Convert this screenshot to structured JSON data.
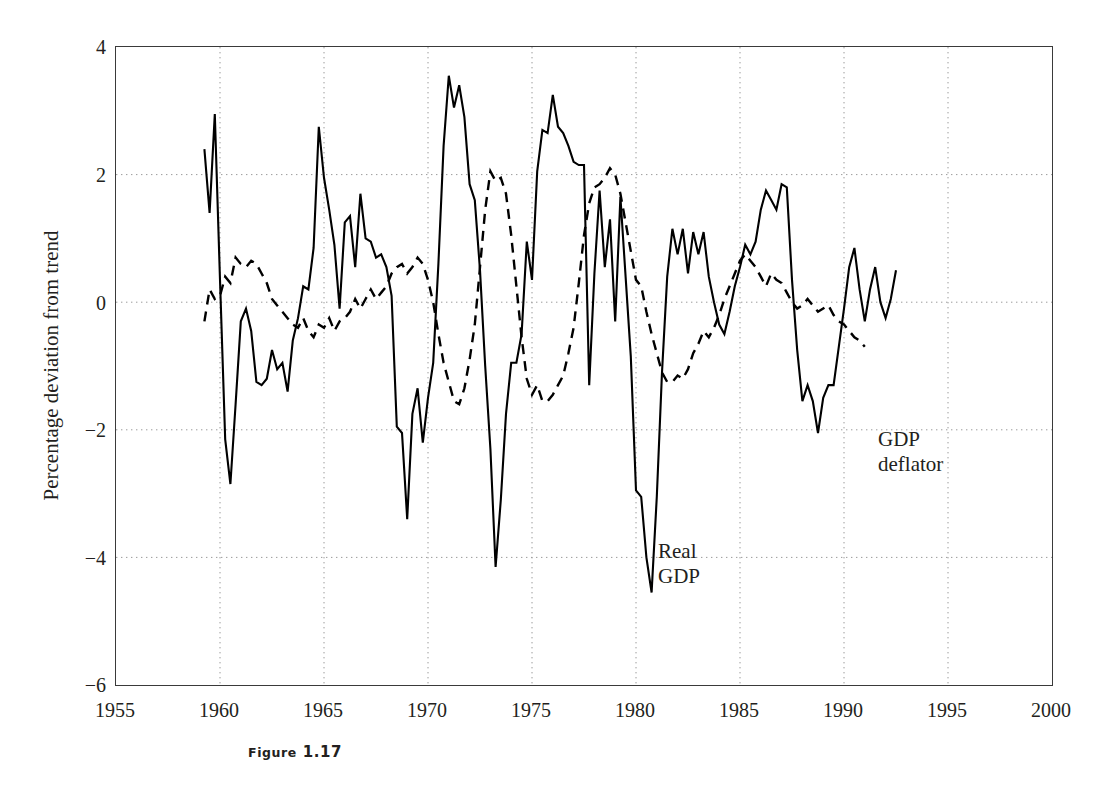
{
  "figure": {
    "caption_label": "Figure",
    "caption_number": "1.17"
  },
  "annotations": {
    "real_gdp_line1": "Real",
    "real_gdp_line2": "GDP",
    "deflator_line1": "GDP",
    "deflator_line2": "deflator"
  },
  "colors": {
    "line": "#000000",
    "axis": "#3a3a3a",
    "grid": "#9a9a9a",
    "text": "#231f20",
    "background": "#ffffff"
  },
  "chart_data": {
    "type": "line",
    "title": "",
    "xlabel": "",
    "ylabel": "Percentage deviation from trend",
    "xlim": [
      1955,
      2000
    ],
    "ylim": [
      -6,
      4
    ],
    "xticks": [
      1955,
      1960,
      1965,
      1970,
      1975,
      1980,
      1985,
      1990,
      1995,
      2000
    ],
    "xticklabels": [
      "1955",
      "1960",
      "1965",
      "1970",
      "1975",
      "1980",
      "1985",
      "1990",
      "1995",
      "2000"
    ],
    "yticks": [
      4,
      2,
      0,
      -2,
      -4,
      -6
    ],
    "yticklabels": [
      "4",
      "2",
      "0",
      "−2",
      "−4",
      "−6"
    ],
    "grid": true,
    "grid_style": "dotted",
    "legend": "in-plot annotations",
    "x_start": 1959.25,
    "x_step": 0.25,
    "series": [
      {
        "name": "Real GDP",
        "style": "solid",
        "color": "#000000",
        "values": [
          2.4,
          1.4,
          2.95,
          0.35,
          -2.15,
          -2.85,
          -1.6,
          -0.3,
          -0.1,
          -0.45,
          -1.25,
          -1.3,
          -1.2,
          -0.75,
          -1.05,
          -0.95,
          -1.4,
          -0.6,
          -0.25,
          0.25,
          0.2,
          0.85,
          2.75,
          1.95,
          1.45,
          0.9,
          -0.1,
          1.25,
          1.35,
          0.55,
          1.7,
          1.0,
          0.95,
          0.7,
          0.75,
          0.55,
          0.1,
          -1.95,
          -2.05,
          -3.4,
          -1.75,
          -1.35,
          -2.2,
          -1.5,
          -0.95,
          0.6,
          2.45,
          3.55,
          3.05,
          3.4,
          2.9,
          1.85,
          1.6,
          0.5,
          -1.0,
          -2.3,
          -4.15,
          -3.1,
          -1.75,
          -0.95,
          -0.95,
          -0.5,
          0.95,
          0.35,
          2.05,
          2.7,
          2.65,
          3.25,
          2.75,
          2.65,
          2.45,
          2.2,
          2.15,
          2.15,
          -1.3,
          0.45,
          1.75,
          0.55,
          1.3,
          -0.3,
          1.65,
          0.4,
          -0.85,
          -2.95,
          -3.05,
          -4.0,
          -4.55,
          -3.05,
          -1.1,
          0.4,
          1.15,
          0.75,
          1.15,
          0.45,
          1.1,
          0.75,
          1.1,
          0.4,
          0.0,
          -0.35,
          -0.5,
          -0.15,
          0.25,
          0.55,
          0.9,
          0.75,
          0.95,
          1.45,
          1.75,
          1.6,
          1.45,
          1.85,
          1.8,
          0.35,
          -0.75,
          -1.55,
          -1.3,
          -1.55,
          -2.05,
          -1.5,
          -1.3,
          -1.3,
          -0.7,
          -0.1,
          0.55,
          0.85,
          0.2,
          -0.3,
          0.2,
          0.55,
          0.0,
          -0.25,
          0.05,
          0.5
        ]
      },
      {
        "name": "GDP deflator",
        "style": "dashed",
        "color": "#000000",
        "values": [
          -0.3,
          0.2,
          0.05,
          0.1,
          0.4,
          0.3,
          0.7,
          0.6,
          0.55,
          0.65,
          0.6,
          0.45,
          0.3,
          0.05,
          -0.05,
          -0.15,
          -0.25,
          -0.35,
          -0.4,
          -0.25,
          -0.45,
          -0.55,
          -0.35,
          -0.4,
          -0.25,
          -0.45,
          -0.3,
          -0.25,
          -0.15,
          0.05,
          -0.1,
          0.05,
          0.2,
          0.05,
          0.15,
          0.25,
          0.45,
          0.55,
          0.6,
          0.45,
          0.55,
          0.7,
          0.6,
          0.35,
          0.0,
          -0.5,
          -0.95,
          -1.25,
          -1.55,
          -1.6,
          -1.35,
          -0.9,
          -0.35,
          0.55,
          1.45,
          2.05,
          1.9,
          1.95,
          1.7,
          1.05,
          0.25,
          -0.55,
          -1.2,
          -1.45,
          -1.3,
          -1.55,
          -1.55,
          -1.45,
          -1.3,
          -1.15,
          -0.8,
          -0.4,
          0.3,
          1.05,
          1.55,
          1.8,
          1.85,
          1.95,
          2.1,
          2.0,
          1.7,
          1.25,
          0.8,
          0.35,
          0.25,
          -0.15,
          -0.5,
          -0.8,
          -1.1,
          -1.25,
          -1.25,
          -1.15,
          -1.2,
          -1.05,
          -0.8,
          -0.65,
          -0.45,
          -0.55,
          -0.4,
          -0.2,
          0.05,
          0.25,
          0.45,
          0.65,
          0.75,
          0.65,
          0.55,
          0.4,
          0.25,
          0.45,
          0.35,
          0.3,
          0.15,
          0.0,
          -0.1,
          -0.05,
          0.05,
          -0.05,
          -0.15,
          -0.1,
          -0.05,
          -0.2,
          -0.3,
          -0.35,
          -0.45,
          -0.55,
          -0.6,
          -0.7
        ]
      }
    ]
  }
}
